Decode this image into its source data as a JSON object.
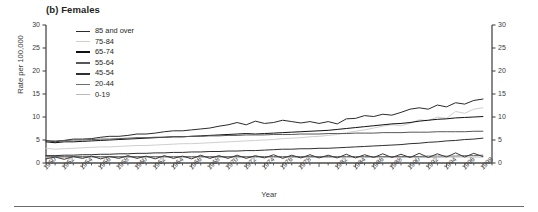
{
  "figure": {
    "panel_title": "(b) Females",
    "x_axis_title": "Year",
    "y_axis_title": "Rate per 100,000"
  },
  "legend": {
    "items": [
      {
        "label": "85 and over",
        "color": "#2b2b2b",
        "width": 1.9
      },
      {
        "label": "75-84",
        "color": "#cfcfcf",
        "width": 1.9
      },
      {
        "label": "65-74",
        "color": "#111111",
        "width": 2.4
      },
      {
        "label": "55-64",
        "color": "#575757",
        "width": 2.1
      },
      {
        "label": "45-54",
        "color": "#2f2f2f",
        "width": 2.1
      },
      {
        "label": "20-44",
        "color": "#6e6e6e",
        "width": 1.9
      },
      {
        "label": "0-19",
        "color": "#b9b9b9",
        "width": 1.9
      }
    ]
  },
  "chart_data": {
    "type": "line",
    "title": "(b) Females",
    "xlabel": "Year",
    "ylabel": "Rate per 100,000",
    "xlim": [
      1950,
      1999
    ],
    "ylim": [
      0,
      30
    ],
    "yticks": [
      0,
      5,
      10,
      15,
      20,
      25,
      30
    ],
    "ytick_labels": [
      "0",
      "5",
      "10",
      "15",
      "20",
      "25",
      "30"
    ],
    "right_axis": true,
    "right_ytick_labels": [
      "0",
      "5",
      "10",
      "15",
      "20",
      "25",
      "30"
    ],
    "grid": false,
    "legend_position": "upper-left-inside",
    "x": [
      1950,
      1951,
      1952,
      1953,
      1954,
      1955,
      1956,
      1957,
      1958,
      1959,
      1960,
      1961,
      1962,
      1963,
      1964,
      1965,
      1966,
      1967,
      1968,
      1969,
      1970,
      1971,
      1972,
      1973,
      1974,
      1975,
      1976,
      1977,
      1978,
      1979,
      1980,
      1981,
      1982,
      1983,
      1984,
      1985,
      1986,
      1987,
      1988,
      1989,
      1990,
      1991,
      1992,
      1993,
      1994,
      1995,
      1996,
      1997,
      1998
    ],
    "xtick_labels": [
      "1950",
      "1952",
      "1954",
      "1956",
      "1958",
      "1960",
      "1962",
      "1964",
      "1966",
      "1968",
      "1970",
      "1972",
      "1974",
      "1976",
      "1978",
      "1982",
      "1984",
      "1986",
      "1988",
      "1990",
      "1992",
      "1994",
      "1996",
      "1998"
    ],
    "series": [
      {
        "name": "85 and over",
        "color": "#2b2b2b",
        "values": [
          4.9,
          4.6,
          4.9,
          5.2,
          5.2,
          5.3,
          5.6,
          5.8,
          5.8,
          6.0,
          6.3,
          6.3,
          6.5,
          6.8,
          7.0,
          7.0,
          7.2,
          7.4,
          7.6,
          8.0,
          8.3,
          8.8,
          8.3,
          9.1,
          8.6,
          8.8,
          9.3,
          9.0,
          8.7,
          9.0,
          8.6,
          9.0,
          8.5,
          9.6,
          9.7,
          10.3,
          10.1,
          10.6,
          10.4,
          11.0,
          11.7,
          12.0,
          11.7,
          12.6,
          12.2,
          13.1,
          12.8,
          13.6,
          13.9
        ]
      },
      {
        "name": "75-84",
        "color": "#cfcfcf",
        "values": [
          3.2,
          3.0,
          3.1,
          3.2,
          3.3,
          3.4,
          3.5,
          3.5,
          3.6,
          3.7,
          3.8,
          3.8,
          3.9,
          4.0,
          4.1,
          4.2,
          4.2,
          4.3,
          4.4,
          4.5,
          4.6,
          4.7,
          4.8,
          4.9,
          5.0,
          5.1,
          5.3,
          5.4,
          5.5,
          5.7,
          5.8,
          6.0,
          6.2,
          6.6,
          6.9,
          7.2,
          7.6,
          8.0,
          8.3,
          8.1,
          8.6,
          9.4,
          9.2,
          10.0,
          9.7,
          11.2,
          10.8,
          11.7,
          12.0
        ]
      },
      {
        "name": "65-74",
        "color": "#111111",
        "values": [
          4.6,
          4.4,
          4.6,
          4.6,
          4.7,
          4.8,
          4.9,
          5.0,
          5.1,
          5.2,
          5.3,
          5.4,
          5.5,
          5.6,
          5.7,
          5.7,
          5.8,
          5.9,
          6.0,
          6.1,
          6.2,
          6.3,
          6.4,
          6.3,
          6.4,
          6.5,
          6.6,
          6.7,
          6.8,
          6.9,
          7.0,
          7.1,
          7.3,
          7.5,
          7.7,
          7.9,
          8.1,
          8.3,
          8.5,
          8.6,
          8.8,
          9.1,
          9.3,
          9.5,
          9.6,
          9.8,
          9.9,
          10.0,
          10.1
        ]
      },
      {
        "name": "55-64",
        "color": "#575757",
        "values": [
          4.8,
          4.8,
          4.9,
          5.0,
          5.0,
          5.1,
          5.2,
          5.2,
          5.3,
          5.4,
          5.5,
          5.5,
          5.6,
          5.6,
          5.7,
          5.7,
          5.8,
          5.8,
          5.9,
          5.9,
          6.0,
          6.0,
          6.1,
          6.1,
          6.1,
          6.2,
          6.2,
          6.2,
          6.3,
          6.3,
          6.3,
          6.4,
          6.4,
          6.4,
          6.5,
          6.5,
          6.5,
          6.6,
          6.6,
          6.6,
          6.7,
          6.7,
          6.7,
          6.8,
          6.8,
          6.8,
          6.8,
          6.9,
          6.9
        ]
      },
      {
        "name": "45-54",
        "color": "#2f2f2f",
        "values": [
          1.6,
          1.6,
          1.7,
          1.7,
          1.8,
          1.8,
          1.9,
          1.9,
          2.0,
          2.0,
          2.1,
          2.1,
          2.2,
          2.2,
          2.3,
          2.3,
          2.4,
          2.4,
          2.5,
          2.5,
          2.6,
          2.6,
          2.7,
          2.7,
          2.8,
          2.9,
          3.0,
          3.0,
          3.1,
          3.1,
          3.2,
          3.2,
          3.3,
          3.4,
          3.5,
          3.6,
          3.7,
          3.8,
          3.9,
          4.0,
          4.2,
          4.3,
          4.5,
          4.6,
          4.8,
          4.9,
          5.1,
          5.2,
          5.4
        ]
      },
      {
        "name": "20-44",
        "color": "#6e6e6e",
        "values": [
          1.4,
          1.4,
          1.4,
          1.4,
          1.4,
          1.4,
          1.4,
          1.4,
          1.4,
          1.4,
          1.4,
          1.4,
          1.4,
          1.4,
          1.4,
          1.4,
          1.4,
          1.4,
          1.4,
          1.4,
          1.4,
          1.4,
          1.4,
          1.4,
          1.4,
          1.4,
          1.4,
          1.4,
          1.4,
          1.4,
          1.4,
          1.4,
          1.4,
          1.4,
          1.4,
          1.4,
          1.4,
          1.4,
          1.4,
          1.4,
          1.4,
          1.4,
          1.5,
          1.5,
          1.5,
          1.5,
          1.6,
          1.6,
          1.7
        ]
      },
      {
        "name": "0-19",
        "color": "#b9b9b9",
        "values": [
          1.2,
          1.2,
          1.2,
          1.2,
          1.2,
          1.2,
          1.2,
          1.2,
          1.2,
          1.2,
          1.2,
          1.2,
          1.2,
          1.2,
          1.2,
          1.2,
          1.2,
          1.2,
          1.2,
          1.2,
          1.2,
          1.2,
          1.2,
          1.2,
          1.2,
          1.2,
          1.2,
          1.2,
          1.2,
          1.2,
          1.2,
          1.2,
          1.2,
          1.2,
          1.2,
          1.2,
          1.2,
          1.2,
          1.2,
          1.2,
          1.2,
          1.2,
          1.2,
          1.2,
          1.3,
          1.3,
          1.3,
          1.3,
          1.3
        ]
      },
      {
        "name": "jagged-low-a",
        "color": "#3a3a3a",
        "values": [
          0.9,
          1.3,
          0.8,
          1.4,
          1.0,
          1.5,
          0.9,
          1.4,
          1.0,
          1.6,
          1.0,
          1.5,
          0.9,
          1.6,
          1.0,
          1.5,
          0.9,
          1.7,
          1.0,
          1.6,
          1.0,
          1.7,
          1.0,
          1.6,
          1.1,
          1.8,
          1.0,
          1.7,
          1.1,
          1.8,
          1.1,
          1.7,
          1.1,
          1.9,
          1.1,
          1.8,
          1.2,
          2.0,
          1.2,
          1.9,
          1.2,
          2.1,
          1.2,
          2.0,
          1.3,
          2.2,
          1.3,
          2.1,
          1.4
        ]
      }
    ]
  }
}
